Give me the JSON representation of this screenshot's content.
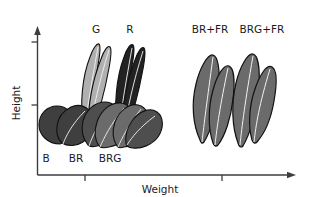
{
  "figure": {
    "type": "diagram",
    "background": "#ffffff",
    "axes": {
      "y": {
        "label": "Height",
        "arrow": true,
        "ticks": 2,
        "color": "#3d3d3d"
      },
      "x": {
        "label": "Weight",
        "arrow": true,
        "ticks": 2,
        "color": "#3d3d3d"
      }
    }
  },
  "palette": {
    "ink": "#1a1a1a",
    "axis": "#3d3d3d",
    "leaf_black": "#222222",
    "leaf_dark": "#3f3f3f",
    "leaf_mid": "#4e4e4e",
    "leaf_gray": "#6b6b6b",
    "leaf_light": "#b0b0b0",
    "outline": "#111111",
    "vein": "#f2f2f2"
  },
  "groups": [
    {
      "id": "B",
      "label": "B",
      "kind": "rosette",
      "label_x": 45,
      "label_y": 158,
      "fill": "#3f3f3f"
    },
    {
      "id": "BR",
      "label": "BR",
      "kind": "rosette",
      "label_x": 72,
      "label_y": 158,
      "fill": "#4e4e4e"
    },
    {
      "id": "BRG",
      "label": "BRG",
      "kind": "rosette",
      "label_x": 101,
      "label_y": 158,
      "fill": "#6b6b6b"
    },
    {
      "id": "G",
      "label": "G",
      "kind": "elongated",
      "label_x": 96,
      "label_y": 33,
      "fill": "#b0b0b0"
    },
    {
      "id": "R",
      "label": "R",
      "kind": "elongated",
      "label_x": 130,
      "label_y": 33,
      "fill": "#222222"
    },
    {
      "id": "BR_FR",
      "label": "BR+FR",
      "kind": "large-elongated",
      "label_x": 200,
      "label_y": 33,
      "fill": "#6b6b6b"
    },
    {
      "id": "BRG_FR",
      "label": "BRG+FR",
      "kind": "large-elongated",
      "label_x": 251,
      "label_y": 33,
      "fill": "#6b6b6b"
    }
  ]
}
